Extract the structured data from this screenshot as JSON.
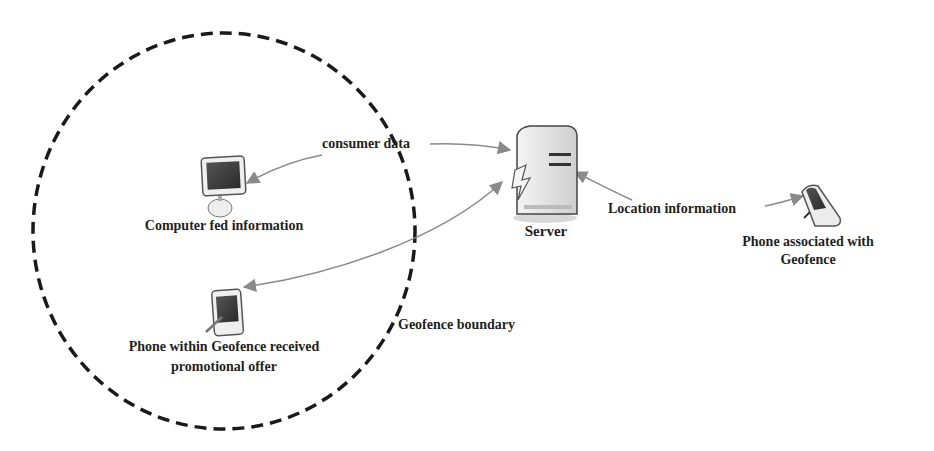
{
  "diagram": {
    "boundary": {
      "label": "Geofence boundary",
      "style": "dashed-ellipse",
      "color": "#1a1a1a"
    },
    "nodes": {
      "server": {
        "label": "Server",
        "icon": "server-icon"
      },
      "computer": {
        "label": "Computer fed information",
        "icon": "computer-monitor-icon"
      },
      "phone_inside": {
        "label_line1": "Phone within Geofence received",
        "label_line2": "promotional offer",
        "icon": "pda-phone-icon"
      },
      "phone_outside": {
        "label_line1": "Phone associated with",
        "label_line2": "Geofence",
        "icon": "flip-phone-icon"
      }
    },
    "edges": [
      {
        "from": "computer",
        "to": "server",
        "label": "consumer data",
        "bidirectional": true
      },
      {
        "from": "server",
        "to": "phone_inside",
        "label": "",
        "bidirectional": true
      },
      {
        "from": "phone_outside",
        "to": "server",
        "label": "Location information",
        "bidirectional": true
      }
    ],
    "colors": {
      "arrow": "#8a8a8a",
      "text": "#1f1f1f",
      "boundary": "#1a1a1a",
      "screen": "#3a3a3a"
    }
  }
}
